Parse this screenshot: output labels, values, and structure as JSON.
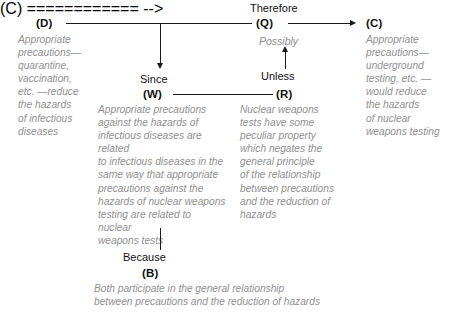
{
  "diagram": {
    "colors": {
      "line": "#1a1a1a",
      "node_key_text": "#111111",
      "body_text": "#8f8f8f",
      "connector_text": "#111111",
      "qualifier_text": "#8a8a8a",
      "background": "#ffffff"
    },
    "nodes": {
      "D": {
        "key": "(D)",
        "text": "Appropriate\nprecautions—\nquarantine,\nvaccination,\netc. —reduce\nthe hazards\nof infectious\ndiseases"
      },
      "W": {
        "key": "(W)",
        "text": "Appropriate precautions\nagainst the hazards of\ninfectious diseases are related\nto infectious diseases in the\nsame way that appropriate\nprecautions against the\nhazards of nuclear weapons\ntesting are related to nuclear\nweapons tests"
      },
      "R": {
        "key": "(R)",
        "text": "Nuclear weapons\ntests have some\npeculiar property\nwhich negates the\ngeneral principle\nof the relationship\nbetween precautions\nand the reduction of\nhazards"
      },
      "Q": {
        "key": "(Q)"
      },
      "C": {
        "key": "(C)",
        "text": "Appropriate\nprecautions—\nunderground\ntesting, etc. —\nwould reduce\nthe hazards\nof nuclear\nweapons testing"
      },
      "B": {
        "key": "(B)",
        "text": "Both participate in the general relationship\nbetween precautions and the reduction of hazards"
      }
    },
    "connectors": {
      "therefore": "Therefore",
      "since": "Since",
      "unless": "Unless",
      "because": "Because",
      "possibly": "Possibly"
    }
  }
}
